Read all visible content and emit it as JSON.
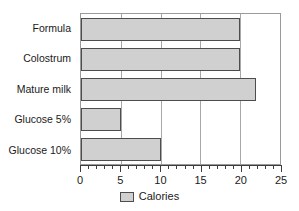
{
  "chart_data": {
    "type": "bar",
    "orientation": "horizontal",
    "title": "",
    "xlabel": "",
    "ylabel": "",
    "categories": [
      "Formula",
      "Colostrum",
      "Mature milk",
      "Glucose 5%",
      "Glucose 10%"
    ],
    "series": [
      {
        "name": "Calories",
        "values": [
          20,
          20,
          22,
          5,
          10
        ],
        "color": "#d0d0d0",
        "border_color": "#4d4d4d"
      }
    ],
    "xlim": [
      0,
      25
    ],
    "xticks": [
      0,
      5,
      10,
      15,
      20,
      25
    ],
    "xtick_labels": [
      "0",
      "5",
      "10",
      "15",
      "20",
      "25"
    ],
    "minor_tick_step": 1,
    "grid": "vertical-major",
    "legend": {
      "position": "bottom-center",
      "entries": [
        "Calories"
      ]
    }
  }
}
